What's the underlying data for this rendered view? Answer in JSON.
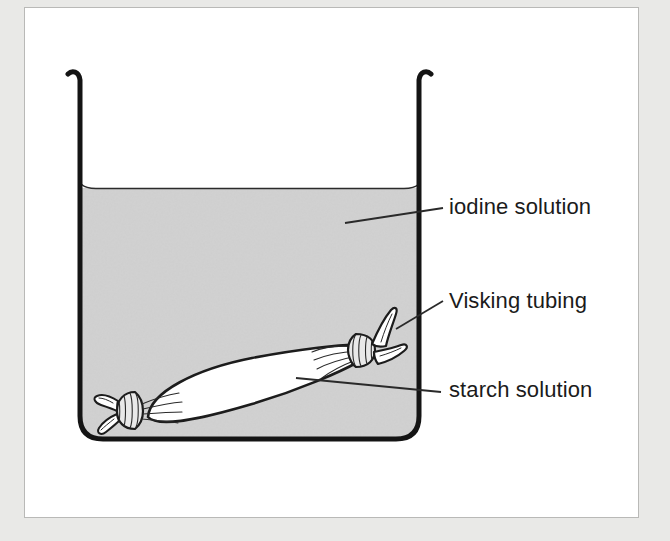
{
  "figure": {
    "background_color": "#e9e9e7",
    "panel_color": "#ffffff",
    "border_color": "#b9b9b7"
  },
  "diagram": {
    "type": "science-experiment-diagram",
    "apparatus": "beaker",
    "beaker": {
      "name": "beaker",
      "outline_color": "#141414",
      "wall_thickness_px": 5,
      "left_wall_x": 78,
      "right_wall_x": 421,
      "rim_top_y": 72,
      "bottom_y": 441
    },
    "liquid": {
      "name": "iodine-solution",
      "fill_color": "#d3d3d3",
      "surface_y": 188,
      "surface_line_color": "#2a2a2a"
    },
    "tubing": {
      "name": "visking-tubing",
      "fill_color": "#ffffff",
      "outline_color": "#1c1c1c",
      "tilt_degrees": -20,
      "knot_band_color": "#e6e6e6",
      "left_knot": {
        "x": 124,
        "y": 410
      },
      "right_knot": {
        "x": 362,
        "y": 343
      }
    },
    "leader_lines": [
      {
        "name": "leader-iodine",
        "from": {
          "x": 345,
          "y": 223
        },
        "to": {
          "x": 443,
          "y": 208
        }
      },
      {
        "name": "leader-visking",
        "from": {
          "x": 396,
          "y": 329
        },
        "to": {
          "x": 443,
          "y": 301
        }
      },
      {
        "name": "leader-starch",
        "from": {
          "x": 296,
          "y": 378
        },
        "to": {
          "x": 441,
          "y": 392
        }
      }
    ],
    "leader_color": "#2a2a2a"
  },
  "labels": {
    "iodine": "iodine solution",
    "visking": "Visking tubing",
    "starch": "starch solution"
  }
}
